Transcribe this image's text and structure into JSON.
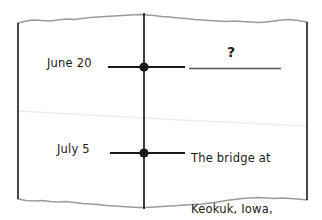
{
  "scene": {
    "kind": "torn-paper-timeline-sketch",
    "paper_color": "#ffffff",
    "ink_color": "#1a1a1a",
    "torn_edge_color": "#9a9a9a",
    "crease_color": "#ededed",
    "blank_line_color": "#555555"
  },
  "timeline": {
    "axis_label": "vertical-timeline",
    "events": [
      {
        "date_label": "June 20",
        "marker": "filled-dot",
        "value_text": "?",
        "value_state": "unknown-blank-line"
      },
      {
        "date_label": "July 5",
        "marker": "filled-dot",
        "value_state": "answered",
        "note_lines": [
          "The bridge at",
          "Keokuk, Iowa,",
          "was closed."
        ]
      }
    ]
  },
  "annotations": {
    "unknown_symbol": "?",
    "june_label": "June 20",
    "july_label": "July 5",
    "note_line_1": "The bridge at",
    "note_line_2": "Keokuk, Iowa,",
    "note_line_3": "was closed."
  }
}
